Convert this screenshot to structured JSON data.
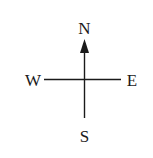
{
  "diagram": {
    "type": "compass-rose",
    "labels": {
      "north": "N",
      "south": "S",
      "east": "E",
      "west": "W"
    },
    "colors": {
      "stroke": "#1a1a1a",
      "text": "#1a1a1a",
      "background": "#ffffff"
    },
    "arrow_direction": "north"
  }
}
